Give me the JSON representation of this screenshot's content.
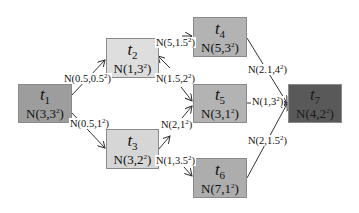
{
  "diagram": {
    "type": "task-dag",
    "colors": {
      "t1": "#9d9d9d",
      "t2": "#dedede",
      "t3": "#d6d6d6",
      "t4": "#b3b3b3",
      "t5": "#b3b3b3",
      "t6": "#adadad",
      "t7": "#595959",
      "edge": "#333333"
    },
    "nodes": [
      {
        "id": "t1",
        "name": "t",
        "sub": "1",
        "mu": "3",
        "sigma": "3"
      },
      {
        "id": "t2",
        "name": "t",
        "sub": "2",
        "mu": "1",
        "sigma": "3"
      },
      {
        "id": "t3",
        "name": "t",
        "sub": "3",
        "mu": "3",
        "sigma": "2"
      },
      {
        "id": "t4",
        "name": "t",
        "sub": "4",
        "mu": "5",
        "sigma": "3"
      },
      {
        "id": "t5",
        "name": "t",
        "sub": "5",
        "mu": "3",
        "sigma": "1"
      },
      {
        "id": "t6",
        "name": "t",
        "sub": "6",
        "mu": "7",
        "sigma": "1"
      },
      {
        "id": "t7",
        "name": "t",
        "sub": "7",
        "mu": "4",
        "sigma": "2"
      }
    ],
    "edges": [
      {
        "from": "t1",
        "to": "t2",
        "mu": "0.5",
        "sigma": "0.5"
      },
      {
        "from": "t1",
        "to": "t3",
        "mu": "0.5",
        "sigma": "1"
      },
      {
        "from": "t2",
        "to": "t4",
        "mu": "5",
        "sigma": "1.5"
      },
      {
        "from": "t2",
        "to": "t5",
        "mu": "1.5",
        "sigma": "2"
      },
      {
        "from": "t3",
        "to": "t5",
        "mu": "2",
        "sigma": "1"
      },
      {
        "from": "t3",
        "to": "t6",
        "mu": "1",
        "sigma": "3.5"
      },
      {
        "from": "t4",
        "to": "t7",
        "mu": "2.1",
        "sigma": "4"
      },
      {
        "from": "t5",
        "to": "t7",
        "mu": "1",
        "sigma": "3"
      },
      {
        "from": "t6",
        "to": "t7",
        "mu": "2",
        "sigma": "1.5"
      }
    ],
    "dist_prefix": "N(",
    "dist_sep": ",",
    "dist_suffix": ")",
    "exponent": "2"
  }
}
